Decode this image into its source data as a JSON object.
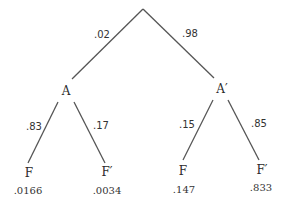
{
  "diagram": {
    "type": "probability-tree",
    "root": {
      "branches": [
        {
          "probability": ".02",
          "node": "A",
          "branches": [
            {
              "probability": ".83",
              "node": "F",
              "joint": ".0166"
            },
            {
              "probability": ".17",
              "node": "F′",
              "joint": ".0034"
            }
          ]
        },
        {
          "probability": ".98",
          "node": "A′",
          "branches": [
            {
              "probability": ".15",
              "node": "F",
              "joint": ".147"
            },
            {
              "probability": ".85",
              "node": "F′",
              "joint": ".833"
            }
          ]
        }
      ]
    },
    "line_color": "#555555"
  }
}
